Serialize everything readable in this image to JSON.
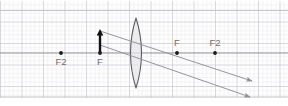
{
  "figure": {
    "kind": "optics-ray-diagram",
    "width": 288,
    "height": 106,
    "background_color": "#ffffff"
  },
  "grid": {
    "minor_spacing_px": 4.3,
    "major_spacing_px": 21.5,
    "minor_color": "#e2e2e6",
    "major_color": "#b9b9c0",
    "border_color": "#bdbdc4"
  },
  "optical_axis": {
    "label": "optical-axis",
    "y": 53,
    "x_start": 0,
    "x_end": 288,
    "color": "#8a8a90"
  },
  "lens": {
    "label": "converging-lens",
    "type": "biconvex",
    "center_x": 136,
    "top_y": 18,
    "bottom_y": 88,
    "half_width_px": 5.5,
    "stroke_color": "#5d5d63",
    "fill_color": "#e7e7ea"
  },
  "object": {
    "label": "object-arrow",
    "x": 100,
    "base_y": 53,
    "tip_y": 31,
    "color": "#111111",
    "direction": "up"
  },
  "focal_points": [
    {
      "id": "left-f2",
      "label": "F2",
      "x": 61,
      "y": 53,
      "label_x": 61,
      "label_y": 65,
      "side": "left"
    },
    {
      "id": "left-f",
      "label": "F",
      "x": 100,
      "y": 53,
      "label_x": 100,
      "label_y": 65,
      "side": "left"
    },
    {
      "id": "right-f",
      "label": "F",
      "x": 177,
      "y": 53,
      "label_x": 177,
      "label_y": 46,
      "side": "right"
    },
    {
      "id": "right-f2",
      "label": "F2",
      "x": 215,
      "y": 53,
      "label_x": 215,
      "label_y": 46,
      "side": "right"
    }
  ],
  "point_style": {
    "color": "#1a1a1a",
    "radius": 1.9
  },
  "rays": [
    {
      "id": "ray-upper",
      "label": "ray-parallel-then-through-focus",
      "x1": 100,
      "y1": 31,
      "x2": 252,
      "y2": 81,
      "color": "#8f8f96",
      "arrowhead": true
    },
    {
      "id": "ray-lower",
      "label": "ray-through-center",
      "x1": 100,
      "y1": 45,
      "x2": 250,
      "y2": 97,
      "color": "#8f8f96",
      "arrowhead": true
    }
  ],
  "colors": {
    "ray": "#8f8f96",
    "axis": "#8a8a90",
    "object": "#111111",
    "label_text": "#6f6f6f",
    "grid_minor": "#e2e2e6",
    "grid_major": "#b9b9c0"
  }
}
